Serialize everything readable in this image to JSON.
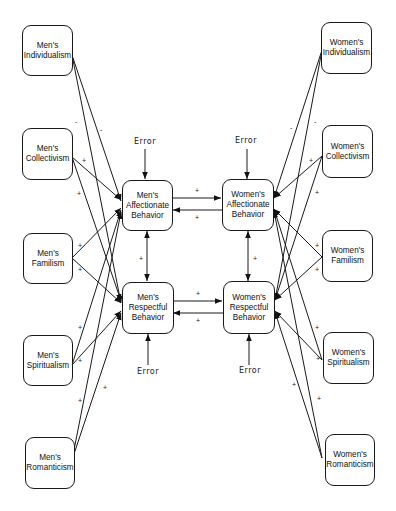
{
  "diagram": {
    "type": "path-model",
    "left_constructs": [
      {
        "id": "m_ind",
        "label": "Men's\nIndividualism"
      },
      {
        "id": "m_col",
        "label": "Men's\nCollectivism"
      },
      {
        "id": "m_fam",
        "label": "Men's\nFamilism"
      },
      {
        "id": "m_spi",
        "label": "Men's\nSpiritualism"
      },
      {
        "id": "m_rom",
        "label": "Men's\nRomanticism"
      }
    ],
    "outcomes": [
      {
        "id": "m_aff",
        "label": "Men's\nAffectionate\nBehavior"
      },
      {
        "id": "m_res",
        "label": "Men's\nRespectful\nBehavior"
      },
      {
        "id": "w_aff",
        "label": "Women's\nAffectionate\nBehavior"
      },
      {
        "id": "w_res",
        "label": "Women's\nRespectful\nBehavior"
      }
    ],
    "right_constructs": [
      {
        "id": "w_ind",
        "label": "Women's\nIndividualism"
      },
      {
        "id": "w_col",
        "label": "Women's\nCollectivism"
      },
      {
        "id": "w_fam",
        "label": "Women's\nFamilism"
      },
      {
        "id": "w_spi",
        "label": "Women's\nSpiritualism"
      },
      {
        "id": "w_rom",
        "label": "Women's\nRomanticism"
      }
    ],
    "error_labels": [
      "Error",
      "Error",
      "Error",
      "Error"
    ],
    "paths": [
      {
        "from": "m_ind",
        "to": "m_aff",
        "sign": "-"
      },
      {
        "from": "m_ind",
        "to": "m_res",
        "sign": "-"
      },
      {
        "from": "m_col",
        "to": "m_aff",
        "sign": "+"
      },
      {
        "from": "m_col",
        "to": "m_res",
        "sign": "+"
      },
      {
        "from": "m_fam",
        "to": "m_aff",
        "sign": "+"
      },
      {
        "from": "m_fam",
        "to": "m_res",
        "sign": "+"
      },
      {
        "from": "m_spi",
        "to": "m_aff",
        "sign": "+"
      },
      {
        "from": "m_spi",
        "to": "m_res",
        "sign": "+"
      },
      {
        "from": "m_rom",
        "to": "m_aff",
        "sign": "+"
      },
      {
        "from": "m_rom",
        "to": "m_res",
        "sign": "+"
      },
      {
        "from": "w_ind",
        "to": "w_aff",
        "sign": "-"
      },
      {
        "from": "w_ind",
        "to": "w_res",
        "sign": "-"
      },
      {
        "from": "w_col",
        "to": "w_aff",
        "sign": "+"
      },
      {
        "from": "w_col",
        "to": "w_res",
        "sign": "+"
      },
      {
        "from": "w_fam",
        "to": "w_aff",
        "sign": "+"
      },
      {
        "from": "w_fam",
        "to": "w_res",
        "sign": "+"
      },
      {
        "from": "w_spi",
        "to": "w_aff",
        "sign": "+"
      },
      {
        "from": "w_spi",
        "to": "w_res",
        "sign": "+"
      },
      {
        "from": "w_rom",
        "to": "w_aff",
        "sign": "+"
      },
      {
        "from": "w_rom",
        "to": "w_res",
        "sign": "+"
      },
      {
        "from": "m_aff",
        "to": "w_aff",
        "sign": "+"
      },
      {
        "from": "w_aff",
        "to": "m_aff",
        "sign": "+"
      },
      {
        "from": "m_res",
        "to": "w_res",
        "sign": "+"
      },
      {
        "from": "w_res",
        "to": "m_res",
        "sign": "+"
      },
      {
        "from": "m_aff",
        "to": "m_res",
        "sign": "+",
        "bidirectional": true
      },
      {
        "from": "w_aff",
        "to": "w_res",
        "sign": "+",
        "bidirectional": true
      }
    ],
    "sign_labels": {
      "minus": "-",
      "plus": "+"
    },
    "colors": {
      "line": "#1a1a1a",
      "background": "#ffffff"
    }
  }
}
